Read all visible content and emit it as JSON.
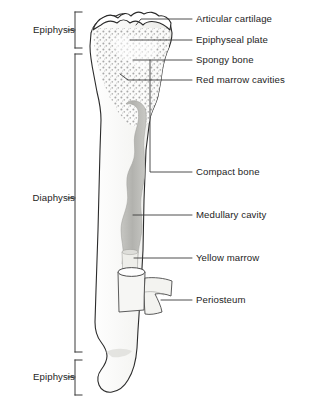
{
  "figure": {
    "background_color": "#ffffff",
    "outline_color": "#2b2b2b",
    "leader_color": "#3a3a3a",
    "bracket_color": "#3a3a3a"
  },
  "region_labels": [
    {
      "id": "epiphysis-proximal",
      "label": "Epiphysis",
      "y": 30,
      "bracket_top": 12,
      "bracket_bottom": 48
    },
    {
      "id": "diaphysis",
      "label": "Diaphysis",
      "y": 198,
      "bracket_top": 54,
      "bracket_bottom": 352
    },
    {
      "id": "epiphysis-distal",
      "label": "Epiphysis",
      "y": 377,
      "bracket_top": 360,
      "bracket_bottom": 395
    }
  ],
  "structure_labels": [
    {
      "id": "articular-cartilage",
      "label": "Articular cartilage",
      "y": 19,
      "leader_from_x": 196,
      "leader_to_x": 141,
      "tip_y": 19
    },
    {
      "id": "epiphyseal-plate",
      "label": "Epiphyseal plate",
      "y": 40,
      "leader_from_x": 196,
      "leader_to_x": 130,
      "tip_y": 40
    },
    {
      "id": "spongy-bone",
      "label": "Spongy bone",
      "y": 60,
      "leader_from_x": 196,
      "leader_to_x": 133,
      "tip_y": 60
    },
    {
      "id": "red-marrow-cavities",
      "label": "Red marrow cavities",
      "y": 80,
      "leader_from_x": 196,
      "leader_to_x": 128,
      "tip_y": 80
    },
    {
      "id": "compact-bone",
      "label": "Compact bone",
      "y": 172,
      "leader_from_x": 196,
      "leader_to_x": 142,
      "tip_y": 172
    },
    {
      "id": "medullary-cavity",
      "label": "Medullary cavity",
      "y": 215,
      "leader_from_x": 196,
      "leader_to_x": 133,
      "tip_y": 215
    },
    {
      "id": "yellow-marrow",
      "label": "Yellow marrow",
      "y": 258,
      "leader_from_x": 196,
      "leader_to_x": 134,
      "tip_y": 258
    },
    {
      "id": "periosteum",
      "label": "Periosteum",
      "y": 300,
      "leader_from_x": 196,
      "leader_to_x": 161,
      "tip_y": 300
    }
  ],
  "anatomy_parts": [
    {
      "id": "articular-cartilage-cap",
      "name": "articular cartilage cap",
      "fill": "#ffffff",
      "description": "wavy band across proximal end"
    },
    {
      "id": "spongy-bone-region",
      "name": "spongy bone",
      "fill": "#f7f7f7",
      "stipple_color": "#9a9a9a",
      "description": "stippled trabecular texture filling the proximal epiphysis"
    },
    {
      "id": "compact-bone-wall",
      "name": "compact bone",
      "fill": "#f4f4f2",
      "description": "dense outer shaft wall"
    },
    {
      "id": "medullary-cavity-column",
      "name": "medullary cavity",
      "fill": "#b9b9b5",
      "description": "irregular grey column down the shaft"
    },
    {
      "id": "yellow-marrow-segment",
      "name": "yellow marrow",
      "fill": "#e8e8e4",
      "description": "pale segment at base of medullary cavity"
    },
    {
      "id": "periosteum-flap",
      "name": "periosteum",
      "fill": "#f2f2ef",
      "description": "membrane peeled back from the shaft"
    },
    {
      "id": "distal-epiphysis",
      "name": "distal epiphysis",
      "fill": "#f4f4f2",
      "description": "flared condylar end"
    }
  ]
}
